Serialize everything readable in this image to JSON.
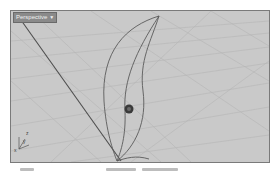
{
  "viewport": {
    "title": "Perspective",
    "title_menu_icon": "triangle-down-icon",
    "background_color": "#c9c9c9",
    "grid_color": "#b3b3b3",
    "curve_color": "#5a5a5a"
  },
  "axes_widget": {
    "labels": [
      "z",
      "y",
      "x"
    ]
  },
  "gumball": {
    "icon": "gumball-handle-icon"
  }
}
